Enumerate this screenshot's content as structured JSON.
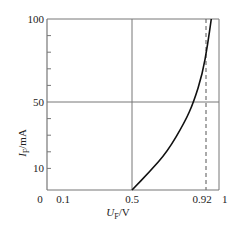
{
  "chart_data": {
    "type": "line",
    "title": "",
    "xlabel": {
      "symbol": "U",
      "subscript": "F",
      "unit": "/V"
    },
    "ylabel": {
      "symbol": "I",
      "subscript": "F",
      "unit": "/mA"
    },
    "xlim": [
      0,
      1
    ],
    "ylim": [
      0,
      100
    ],
    "x_tick_labels": [
      "0",
      "0.1",
      "0.5",
      "0.92",
      "1"
    ],
    "x_tick_values": [
      0,
      0.1,
      0.5,
      0.92,
      1
    ],
    "y_tick_labels": [
      "10",
      "50",
      "100"
    ],
    "y_tick_values": [
      10,
      50,
      100
    ],
    "y_minor_ticks": [
      20,
      30,
      40,
      60,
      70,
      80,
      90
    ],
    "grid_lines": {
      "horizontal": [
        50,
        100
      ],
      "vertical_solid": [
        0.5,
        1
      ],
      "vertical_dashed": [
        0.92
      ]
    },
    "series": [
      {
        "name": "forward characteristic",
        "x": [
          0.5,
          0.6,
          0.7,
          0.8,
          0.85,
          0.9,
          0.93,
          0.95
        ],
        "y": [
          0,
          8,
          20,
          38,
          50,
          67,
          85,
          100
        ]
      }
    ],
    "colors": {
      "axis": "#777777",
      "curve": "#111111",
      "dashed": "#555555"
    }
  }
}
